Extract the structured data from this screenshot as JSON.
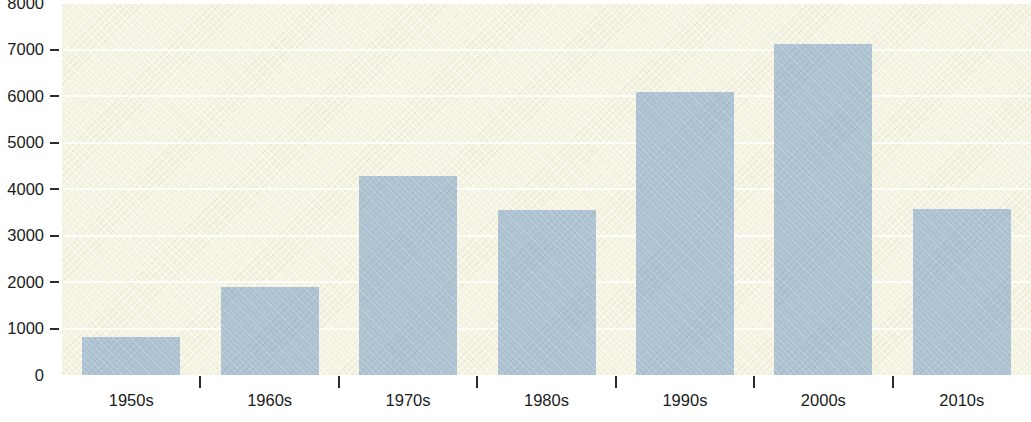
{
  "chart_data": {
    "type": "bar",
    "title": "",
    "xlabel": "",
    "ylabel": "",
    "categories": [
      "1950s",
      "1960s",
      "1970s",
      "1980s",
      "1990s",
      "2000s",
      "2010s"
    ],
    "values": [
      820,
      1900,
      4270,
      3550,
      6080,
      7120,
      3580
    ],
    "ylim": [
      0,
      8000
    ],
    "ytick_labels": [
      "8000",
      "7000",
      "6000",
      "5000",
      "4000",
      "3000",
      "2000",
      "1000",
      "0"
    ],
    "ytick_values": [
      8000,
      7000,
      6000,
      5000,
      4000,
      3000,
      2000,
      1000,
      0
    ],
    "ytick_step": 1000,
    "grid": true,
    "grid_axis": "y",
    "legend": false,
    "legend_position": "none",
    "series": [
      {
        "name": "Count by decade",
        "values": [
          820,
          1900,
          4270,
          3550,
          6080,
          7120,
          3580
        ]
      }
    ],
    "colors": {
      "bar": "#aec3d1",
      "plot_background": "#f5f4e3",
      "page_background": "#ffffff",
      "gridline": "#ffffff",
      "axis_text": "#1b1b1b",
      "tick_mark": "#2b2b2b"
    }
  },
  "axes": {
    "y_ticks": [
      {
        "label": "8000",
        "value": 8000,
        "mark": false
      },
      {
        "label": "7000",
        "value": 7000,
        "mark": true
      },
      {
        "label": "6000",
        "value": 6000,
        "mark": true
      },
      {
        "label": "5000",
        "value": 5000,
        "mark": true
      },
      {
        "label": "4000",
        "value": 4000,
        "mark": true
      },
      {
        "label": "3000",
        "value": 3000,
        "mark": true
      },
      {
        "label": "2000",
        "value": 2000,
        "mark": true
      },
      {
        "label": "1000",
        "value": 1000,
        "mark": true
      },
      {
        "label": "0",
        "value": 0,
        "mark": false
      }
    ],
    "x_ticks": [
      {
        "label": "1950s",
        "value": 820
      },
      {
        "label": "1960s",
        "value": 1900
      },
      {
        "label": "1970s",
        "value": 4270
      },
      {
        "label": "1980s",
        "value": 3550
      },
      {
        "label": "1990s",
        "value": 6080
      },
      {
        "label": "2000s",
        "value": 7120
      },
      {
        "label": "2010s",
        "value": 3580
      }
    ]
  }
}
